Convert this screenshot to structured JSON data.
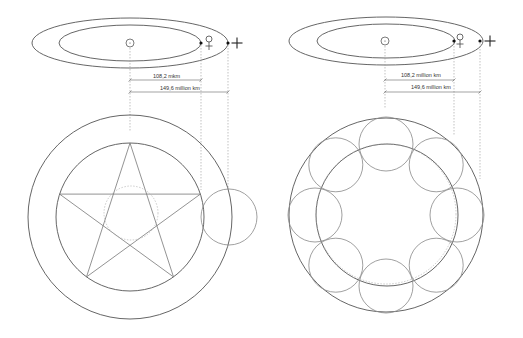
{
  "diagrams": [
    {
      "name": "venus-earth-pentagram",
      "orbit_labels": {
        "venus_distance": "108,2 mkm",
        "earth_distance": "149,6 million km"
      },
      "symbols": {
        "sun": "☉",
        "venus": "♀",
        "earth": "+"
      },
      "figure": "pentagram"
    },
    {
      "name": "venus-earth-flower",
      "orbit_labels": {
        "venus_distance": "108,2 million km",
        "earth_distance": "149,6 million km"
      },
      "symbols": {
        "sun": "☉",
        "venus": "♀",
        "earth": "+"
      },
      "figure": "eight-circles"
    }
  ],
  "colors": {
    "line": "#555555",
    "light_line": "#888888",
    "dashed": "#999999",
    "background": "#ffffff"
  }
}
